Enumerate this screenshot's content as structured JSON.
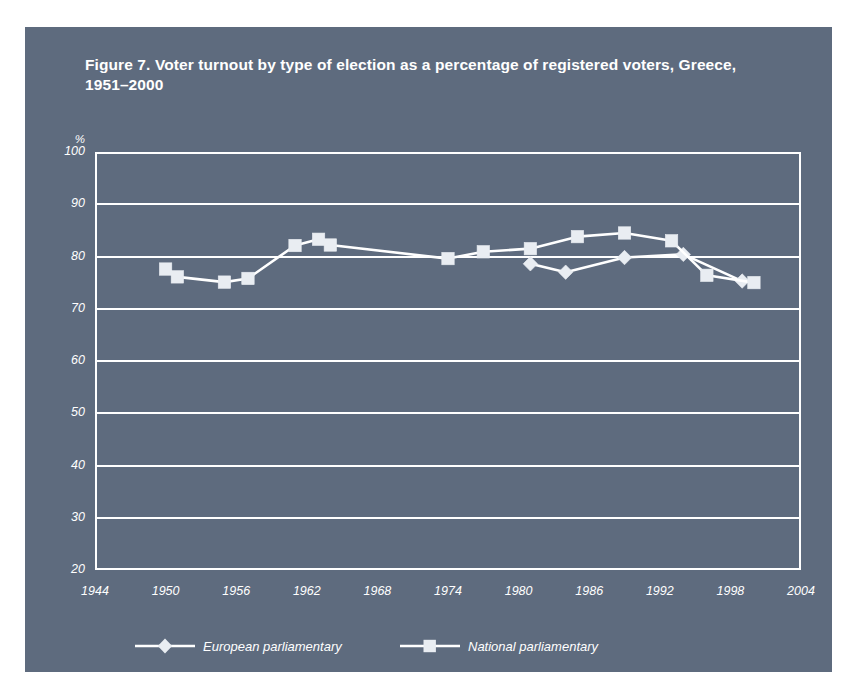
{
  "figure": {
    "title": "Figure 7. Voter turnout by type of election as a percentage of registered voters, Greece, 1951–2000"
  },
  "colors": {
    "panel_background": "#5e6b7e",
    "page_background": "#ffffff",
    "axis": "#ffffff",
    "gridline": "#ffffff",
    "series_line": "#ffffff",
    "marker_fill": "#e9edf2",
    "text": "#ffffff"
  },
  "chart_data": {
    "type": "line",
    "title": "Figure 7. Voter turnout by type of election as a percentage of registered voters, Greece, 1951–2000",
    "xlabel": "",
    "ylabel": "%",
    "xlim": [
      1944,
      2004
    ],
    "ylim": [
      20,
      100
    ],
    "xticks": [
      1944,
      1950,
      1956,
      1962,
      1968,
      1974,
      1980,
      1986,
      1992,
      1998,
      2004
    ],
    "yticks": [
      20,
      30,
      40,
      50,
      60,
      70,
      80,
      90,
      100
    ],
    "grid": true,
    "legend_position": "bottom",
    "series": [
      {
        "name": "European parliamentary",
        "marker": "diamond",
        "points": [
          {
            "x": 1981,
            "y": 78.6
          },
          {
            "x": 1984,
            "y": 77.0
          },
          {
            "x": 1989,
            "y": 79.8
          },
          {
            "x": 1994,
            "y": 80.4
          },
          {
            "x": 1999,
            "y": 75.3
          }
        ]
      },
      {
        "name": "National parliamentary",
        "marker": "square",
        "points": [
          {
            "x": 1950,
            "y": 77.6
          },
          {
            "x": 1951,
            "y": 76.1
          },
          {
            "x": 1955,
            "y": 75.1
          },
          {
            "x": 1957,
            "y": 75.8
          },
          {
            "x": 1961,
            "y": 82.1
          },
          {
            "x": 1963,
            "y": 83.3
          },
          {
            "x": 1964,
            "y": 82.2
          },
          {
            "x": 1974,
            "y": 79.6
          },
          {
            "x": 1977,
            "y": 80.9
          },
          {
            "x": 1981,
            "y": 81.5
          },
          {
            "x": 1985,
            "y": 83.8
          },
          {
            "x": 1989,
            "y": 84.5
          },
          {
            "x": 1993,
            "y": 83.0
          },
          {
            "x": 1996,
            "y": 76.4
          },
          {
            "x": 2000,
            "y": 75.0
          }
        ]
      }
    ]
  },
  "axes": {
    "y_unit": "%",
    "y_tick_labels": [
      "100",
      "90",
      "80",
      "70",
      "60",
      "50",
      "40",
      "30",
      "20"
    ],
    "x_tick_labels": [
      "1944",
      "1950",
      "1956",
      "1962",
      "1968",
      "1974",
      "1980",
      "1986",
      "1992",
      "1998",
      "2004"
    ]
  },
  "legend": {
    "items": [
      {
        "label": "European parliamentary",
        "marker": "diamond"
      },
      {
        "label": "National parliamentary",
        "marker": "square"
      }
    ]
  }
}
